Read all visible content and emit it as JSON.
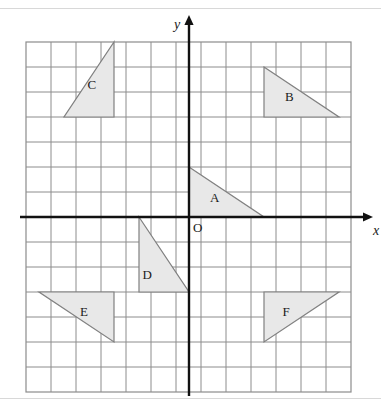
{
  "figure": {
    "type": "coordinate-grid-with-triangles",
    "background": "#ffffff",
    "grid": {
      "x0": 26,
      "y0": 42,
      "cell": 25,
      "cols": 13,
      "rows": 14,
      "line_color": "#8c8c8c",
      "border_color": "#8c8c8c"
    },
    "axes": {
      "color": "#111111",
      "x_axis_label": "x",
      "y_axis_label": "y",
      "origin_label": "O",
      "origin_px": {
        "x": 189,
        "y": 217
      },
      "x_axis_y_px": 217,
      "y_axis_x_px": 189,
      "x_arrow_end_px": 366,
      "y_arrow_end_px": 22
    },
    "shapes_style": {
      "fill": "#e8e8e8",
      "stroke": "#808080",
      "stroke_width": 1.2
    }
  },
  "labels": {
    "x": "x",
    "y": "y",
    "origin": "O",
    "A": "A",
    "B": "B",
    "C": "C",
    "D": "D",
    "E": "E",
    "F": "F"
  },
  "chart_data": {
    "type": "scatter",
    "title": "",
    "xlabel": "x",
    "ylabel": "y",
    "grid": true,
    "legend": "none",
    "xlim": [
      -6.5,
      6.5
    ],
    "ylim": [
      -7,
      7
    ],
    "unit_px": 25,
    "triangles": [
      {
        "name": "A",
        "vertices": [
          [
            0,
            2
          ],
          [
            3,
            0
          ],
          [
            0,
            0
          ]
        ],
        "right_angle_at": "top-left",
        "width_units": 3,
        "height_units": 2,
        "label_pos": [
          1.0,
          0.75
        ]
      },
      {
        "name": "B",
        "vertices": [
          [
            3,
            6
          ],
          [
            6,
            4
          ],
          [
            3,
            4
          ]
        ],
        "right_angle_at": "top-left",
        "width_units": 3,
        "height_units": 2,
        "label_pos": [
          4.0,
          4.8
        ]
      },
      {
        "name": "C",
        "vertices": [
          [
            -3,
            7
          ],
          [
            -3,
            4
          ],
          [
            -5,
            4
          ]
        ],
        "right_angle_at": "bottom-right",
        "width_units": 2,
        "height_units": 3,
        "label_pos": [
          -3.9,
          5.3
        ]
      },
      {
        "name": "D",
        "vertices": [
          [
            -2,
            0
          ],
          [
            0,
            -3
          ],
          [
            -2,
            -3
          ]
        ],
        "right_angle_at": "bottom-left",
        "width_units": 2,
        "height_units": 3,
        "label_pos": [
          -1.7,
          -2.3
        ]
      },
      {
        "name": "E",
        "vertices": [
          [
            -6,
            -3
          ],
          [
            -3,
            -3
          ],
          [
            -3,
            -5
          ]
        ],
        "right_angle_at": "top-right",
        "width_units": 3,
        "height_units": 2,
        "label_pos": [
          -4.2,
          -3.8
        ]
      },
      {
        "name": "F",
        "vertices": [
          [
            3,
            -3
          ],
          [
            6,
            -3
          ],
          [
            3,
            -5
          ]
        ],
        "right_angle_at": "top-left",
        "width_units": 3,
        "height_units": 2,
        "label_pos": [
          3.9,
          -3.8
        ]
      }
    ]
  }
}
